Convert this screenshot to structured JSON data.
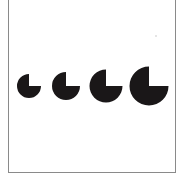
{
  "figure": {
    "fill_color": "#1a1718",
    "background_color": "#ffffff",
    "frame_color": "#8a8a8a",
    "shapes": [
      {
        "id": 1,
        "cx": 29,
        "cy": 86,
        "r": 12,
        "missing_quadrant": "upper-right"
      },
      {
        "id": 2,
        "cx": 66,
        "cy": 86,
        "r": 14,
        "missing_quadrant": "upper-right"
      },
      {
        "id": 3,
        "cx": 106,
        "cy": 86,
        "r": 16.5,
        "missing_quadrant": "upper-right"
      },
      {
        "id": 4,
        "cx": 149,
        "cy": 86,
        "r": 19.5,
        "missing_quadrant": "upper-right"
      }
    ]
  }
}
